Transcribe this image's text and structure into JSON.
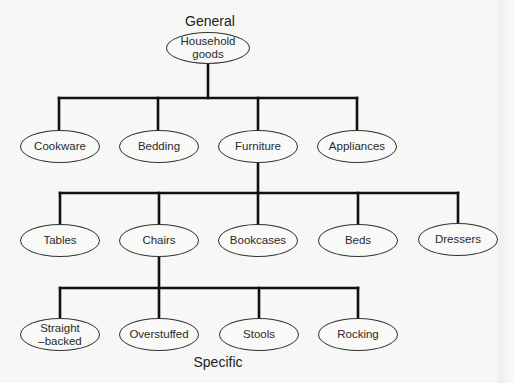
{
  "labels": {
    "top": "General",
    "bottom": "Specific"
  },
  "colors": {
    "background": "#f7f7f6",
    "line": "#111111",
    "node_border": "#333333",
    "text": "#222222"
  },
  "root": {
    "line1": "Household",
    "line2": "goods"
  },
  "level1": [
    {
      "label": "Cookware"
    },
    {
      "label": "Bedding"
    },
    {
      "label": "Furniture"
    },
    {
      "label": "Appliances"
    }
  ],
  "level2": [
    {
      "label": "Tables"
    },
    {
      "label": "Chairs"
    },
    {
      "label": "Bookcases"
    },
    {
      "label": "Beds"
    },
    {
      "label": "Dressers"
    }
  ],
  "level3": [
    {
      "line1": "Straight",
      "line2": "–backed"
    },
    {
      "label": "Overstuffed"
    },
    {
      "label": "Stools"
    },
    {
      "label": "Rocking"
    }
  ]
}
